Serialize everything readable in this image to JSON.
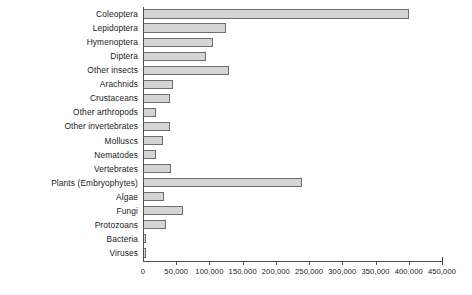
{
  "chart_data": {
    "type": "bar",
    "orientation": "horizontal",
    "title": "",
    "xlabel": "",
    "ylabel": "",
    "xlim": [
      0,
      450000
    ],
    "xticks": [
      0,
      50000,
      100000,
      150000,
      200000,
      250000,
      300000,
      350000,
      400000,
      450000
    ],
    "xtick_labels": [
      "0",
      "50,000",
      "100,000",
      "150,000",
      "200,000",
      "250,000",
      "300,000",
      "350,000",
      "400,000",
      "450,000"
    ],
    "grid": false,
    "legend": false,
    "bar_color": "#d4d4d4",
    "bar_edge_color": "#6e6e6e",
    "axis_color": "#4d4d4d",
    "categories": [
      "Coleoptera",
      "Lepidoptera",
      "Hymenoptera",
      "Diptera",
      "Other  insects",
      "Arachnids",
      "Crustaceans",
      "Other arthropods",
      "Other invertebrates",
      "Molluscs",
      "Nematodes",
      "Vertebrates",
      "Plants (Embryophytes)",
      "Algae",
      "Fungi",
      "Protozoans",
      "Bacteria",
      "Viruses"
    ],
    "values": [
      400000,
      125000,
      105000,
      95000,
      130000,
      45000,
      40000,
      20000,
      40000,
      30000,
      20000,
      42000,
      240000,
      32000,
      60000,
      35000,
      5000,
      5000
    ]
  }
}
